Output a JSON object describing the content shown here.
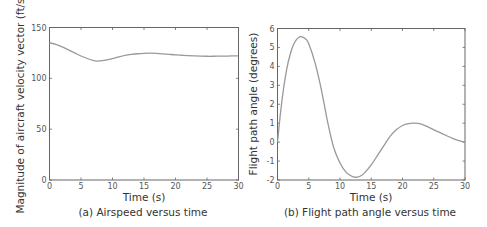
{
  "chart_data": [
    {
      "type": "line",
      "caption": "(a) Airspeed versus time",
      "xlabel": "Time (s)",
      "ylabel": "Magnitude of aircraft velocity vector (ft/s)",
      "xlim": [
        0,
        30
      ],
      "ylim": [
        0,
        150
      ],
      "xticks": [
        0,
        5,
        10,
        15,
        20,
        25,
        30
      ],
      "yticks": [
        0,
        50,
        100,
        150
      ],
      "grid": false,
      "series": [
        {
          "name": "airspeed",
          "color": "#999999",
          "x": [
            0,
            1,
            2,
            3,
            4,
            5,
            6,
            7,
            7.5,
            8,
            9,
            10,
            11,
            12,
            13,
            14,
            15,
            16,
            17,
            18,
            19,
            20,
            21,
            22,
            23,
            24,
            25,
            26,
            27,
            28,
            29,
            30
          ],
          "y": [
            135,
            133.5,
            131,
            128,
            125,
            122,
            119.5,
            117.5,
            117,
            117.2,
            118,
            119.5,
            121,
            122.5,
            123.5,
            124.2,
            124.6,
            124.7,
            124.5,
            124.1,
            123.6,
            123.1,
            122.7,
            122.3,
            122,
            121.8,
            121.7,
            121.7,
            121.8,
            121.9,
            122,
            122
          ]
        }
      ]
    },
    {
      "type": "line",
      "caption": "(b) Flight path angle versus time",
      "xlabel": "Time (s)",
      "ylabel": "Flight path angle (degrees)",
      "xlim": [
        0,
        30
      ],
      "ylim": [
        -2,
        6
      ],
      "xticks": [
        0,
        5,
        10,
        15,
        20,
        25,
        30
      ],
      "yticks": [
        -2,
        -1,
        0,
        1,
        2,
        3,
        4,
        5,
        6
      ],
      "grid": false,
      "series": [
        {
          "name": "flight path angle",
          "color": "#999999",
          "x": [
            0,
            0.5,
            1,
            1.5,
            2,
            2.5,
            3,
            3.5,
            3.8,
            4.5,
            5,
            6,
            7,
            8,
            9,
            10,
            11,
            12,
            12.8,
            13.5,
            14,
            15,
            16,
            17,
            18,
            19,
            20,
            21,
            22,
            23,
            24,
            25,
            26,
            27,
            28,
            29,
            30
          ],
          "y": [
            0,
            1.6,
            2.9,
            3.9,
            4.6,
            5.1,
            5.4,
            5.55,
            5.57,
            5.45,
            5.2,
            4.2,
            2.8,
            1.1,
            -0.3,
            -1.1,
            -1.6,
            -1.82,
            -1.85,
            -1.75,
            -1.6,
            -1.2,
            -0.7,
            -0.2,
            0.3,
            0.65,
            0.88,
            0.98,
            1.0,
            0.95,
            0.82,
            0.65,
            0.5,
            0.35,
            0.2,
            0.08,
            0
          ]
        }
      ]
    }
  ]
}
